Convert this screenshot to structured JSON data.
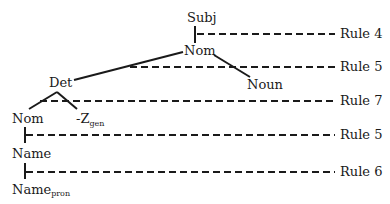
{
  "diagram": {
    "type": "syntax-tree",
    "nodes": {
      "subj": "Subj",
      "nom_top": "Nom",
      "noun": "Noun",
      "det": "Det",
      "nom_mid": "Nom",
      "zgen_base": "-Z",
      "zgen_sub": "gen",
      "name": "Name",
      "name_pron_base": "Name",
      "name_pron_sub": "pron"
    },
    "rules": [
      {
        "label": "Rule 4",
        "between": [
          "Subj",
          "Nom"
        ]
      },
      {
        "label": "Rule 5",
        "between": [
          "Nom",
          "Det / Noun"
        ]
      },
      {
        "label": "Rule 7",
        "between": [
          "Det",
          "Nom / -Z_gen"
        ]
      },
      {
        "label": "Rule 5",
        "between": [
          "Nom",
          "Name"
        ]
      },
      {
        "label": "Rule 6",
        "between": [
          "Name",
          "Name_pron"
        ]
      }
    ],
    "edges": [
      [
        "Subj",
        "Nom"
      ],
      [
        "Nom",
        "Det"
      ],
      [
        "Nom",
        "Noun"
      ],
      [
        "Det",
        "Nom"
      ],
      [
        "Det",
        "-Z_gen"
      ],
      [
        "Nom",
        "Name"
      ],
      [
        "Name",
        "Name_pron"
      ]
    ]
  }
}
